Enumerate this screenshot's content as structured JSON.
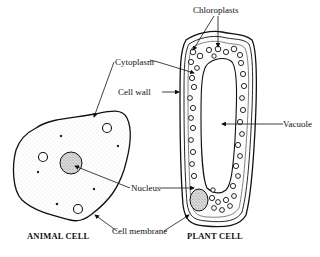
{
  "diagram": {
    "labels": {
      "chloroplasts": "Chloroplasts",
      "cytoplasm": "Cytoplasm",
      "cell_wall": "Cell wall",
      "vacuole": "Vacuole",
      "nucleus": "Nucleus",
      "cell_membrane": "Cell membrane"
    },
    "titles": {
      "animal": "ANIMAL CELL",
      "plant": "PLANT CELL"
    },
    "colors": {
      "ink": "#111111",
      "background": "#ffffff"
    }
  }
}
